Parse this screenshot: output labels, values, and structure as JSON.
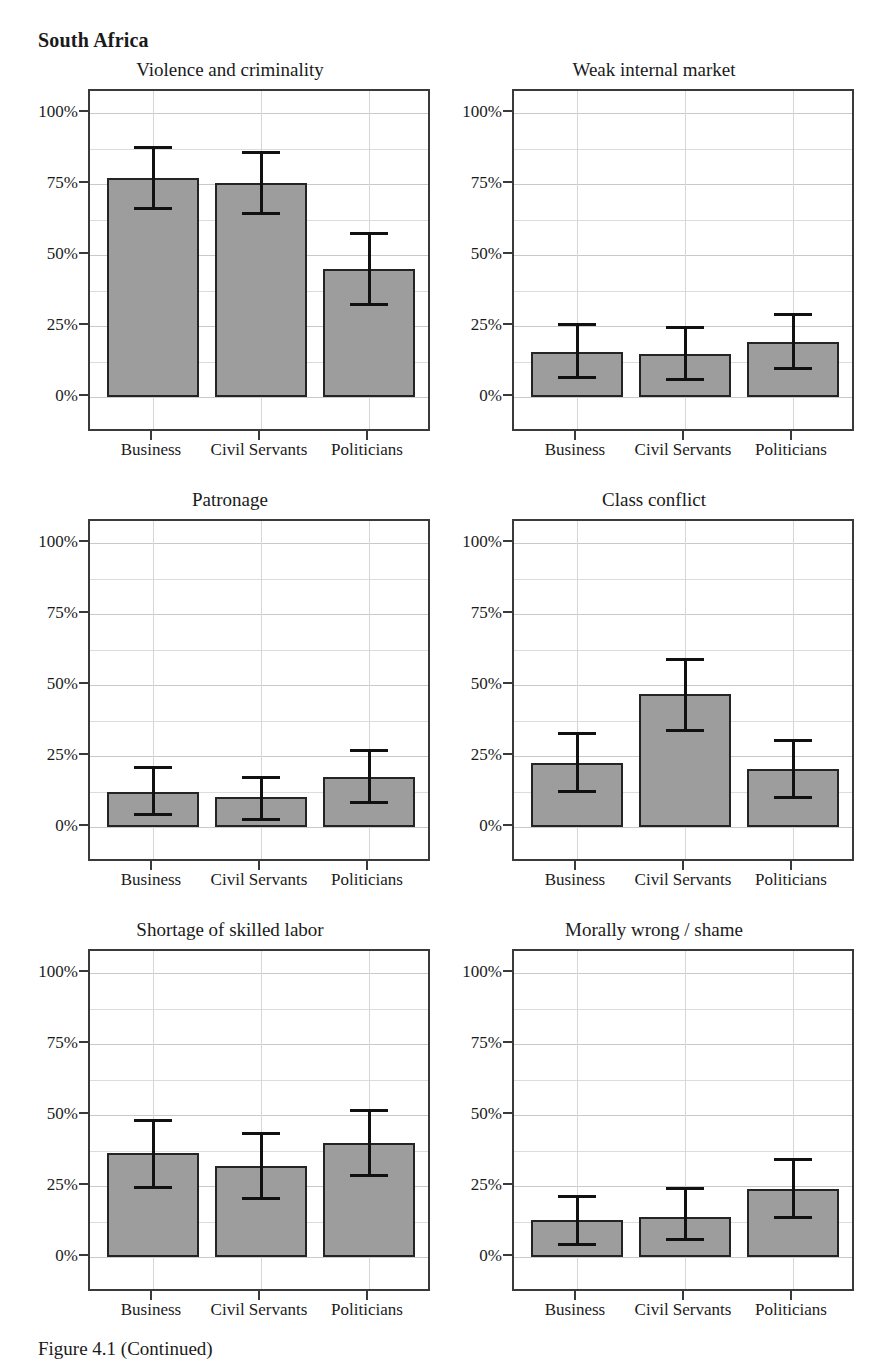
{
  "figure": {
    "country_title": "South Africa",
    "caption": "Figure 4.1 (Continued)"
  },
  "axis": {
    "y_ticks": [
      "0%",
      "25%",
      "50%",
      "75%",
      "100%"
    ],
    "categories": [
      "Business",
      "Civil Servants",
      "Politicians"
    ]
  },
  "style": {
    "bar_fill": "#9d9d9d",
    "bar_stroke": "#242424",
    "error_color": "#111111",
    "frame_color": "#3a3a3a",
    "grid_color": "#c9c9c9",
    "page_background": "#ffffff"
  },
  "chart_data": [
    {
      "type": "bar",
      "title": "Violence and criminality",
      "xlabel": "",
      "ylabel": "",
      "ylim": [
        0,
        100
      ],
      "ytick_values": [
        0,
        25,
        50,
        75,
        100
      ],
      "ytick_labels": [
        "0%",
        "25%",
        "50%",
        "75%",
        "100%"
      ],
      "grid": true,
      "legend": "none",
      "categories": [
        "Business",
        "Civil Servants",
        "Politicians"
      ],
      "values": [
        77.0,
        75.5,
        45.0
      ],
      "ci_low": [
        66.0,
        64.0,
        32.0
      ],
      "ci_high": [
        88.5,
        86.5,
        58.0
      ]
    },
    {
      "type": "bar",
      "title": "Weak internal market",
      "xlabel": "",
      "ylabel": "",
      "ylim": [
        0,
        100
      ],
      "ytick_values": [
        0,
        25,
        50,
        75,
        100
      ],
      "ytick_labels": [
        "0%",
        "25%",
        "50%",
        "75%",
        "100%"
      ],
      "grid": true,
      "legend": "none",
      "categories": [
        "Business",
        "Civil Servants",
        "Politicians"
      ],
      "values": [
        16.0,
        15.0,
        19.5
      ],
      "ci_low": [
        6.5,
        5.5,
        9.5
      ],
      "ci_high": [
        26.0,
        25.0,
        29.5
      ]
    },
    {
      "type": "bar",
      "title": "Patronage",
      "xlabel": "",
      "ylabel": "",
      "ylim": [
        0,
        100
      ],
      "ytick_values": [
        0,
        25,
        50,
        75,
        100
      ],
      "ytick_labels": [
        "0%",
        "25%",
        "50%",
        "75%",
        "100%"
      ],
      "grid": true,
      "legend": "none",
      "categories": [
        "Business",
        "Civil Servants",
        "Politicians"
      ],
      "values": [
        12.5,
        10.5,
        17.5
      ],
      "ci_low": [
        4.0,
        2.0,
        8.0
      ],
      "ci_high": [
        21.5,
        18.0,
        27.5
      ]
    },
    {
      "type": "bar",
      "title": "Class conflict",
      "xlabel": "",
      "ylabel": "",
      "ylim": [
        0,
        100
      ],
      "ytick_values": [
        0,
        25,
        50,
        75,
        100
      ],
      "ytick_labels": [
        "0%",
        "25%",
        "50%",
        "75%",
        "100%"
      ],
      "grid": true,
      "legend": "none",
      "categories": [
        "Business",
        "Civil Servants",
        "Politicians"
      ],
      "values": [
        22.5,
        47.0,
        20.5
      ],
      "ci_low": [
        12.0,
        33.5,
        10.0
      ],
      "ci_high": [
        33.5,
        59.5,
        31.0
      ]
    },
    {
      "type": "bar",
      "title": "Shortage of skilled labor",
      "xlabel": "",
      "ylabel": "",
      "ylim": [
        0,
        100
      ],
      "ytick_values": [
        0,
        25,
        50,
        75,
        100
      ],
      "ytick_labels": [
        "0%",
        "25%",
        "50%",
        "75%",
        "100%"
      ],
      "grid": true,
      "legend": "none",
      "categories": [
        "Business",
        "Civil Servants",
        "Politicians"
      ],
      "values": [
        36.5,
        32.0,
        40.0
      ],
      "ci_low": [
        24.0,
        20.0,
        28.0
      ],
      "ci_high": [
        48.5,
        44.0,
        52.0
      ]
    },
    {
      "type": "bar",
      "title": "Morally wrong / shame",
      "xlabel": "",
      "ylabel": "",
      "ylim": [
        0,
        100
      ],
      "ytick_values": [
        0,
        25,
        50,
        75,
        100
      ],
      "ytick_labels": [
        "0%",
        "25%",
        "50%",
        "75%",
        "100%"
      ],
      "grid": true,
      "legend": "none",
      "categories": [
        "Business",
        "Civil Servants",
        "Politicians"
      ],
      "values": [
        13.0,
        14.0,
        24.0
      ],
      "ci_low": [
        4.0,
        5.5,
        13.5
      ],
      "ci_high": [
        22.0,
        24.5,
        35.0
      ]
    }
  ]
}
